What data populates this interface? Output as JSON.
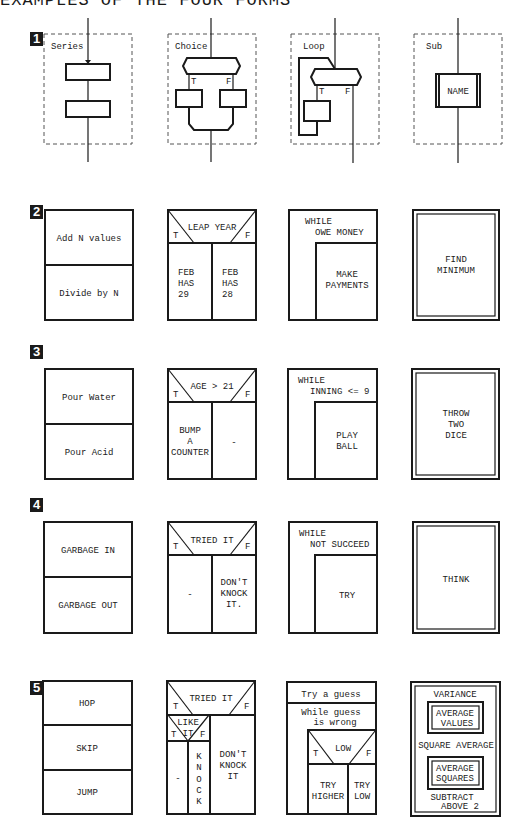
{
  "title": "EXAMPLES OF THE FOUR FORMS",
  "rows": [
    {
      "badge": "1",
      "series_label": "Series",
      "choice_label": "Choice",
      "loop_label": "Loop",
      "sub_label": "Sub",
      "choice_t": "T",
      "choice_f": "F",
      "loop_t": "T",
      "loop_f": "F",
      "sub_name": "NAME"
    },
    {
      "badge": "2",
      "sequence": [
        "Add N values",
        "Divide by N"
      ],
      "if_condition": "LEAP YEAR",
      "if_t": "T",
      "if_f": "F",
      "if_true_lines": [
        "FEB",
        "HAS",
        "29"
      ],
      "if_false_lines": [
        "FEB",
        "HAS",
        "28"
      ],
      "while_lines": [
        "WHILE",
        "OWE MONEY"
      ],
      "while_body_lines": [
        "MAKE",
        "PAYMENTS"
      ],
      "sub_lines": [
        "FIND",
        "MINIMUM"
      ]
    },
    {
      "badge": "3",
      "sequence": [
        "Pour Water",
        "Pour Acid"
      ],
      "if_condition": "AGE > 21",
      "if_t": "T",
      "if_f": "F",
      "if_true_lines": [
        "BUMP",
        "A",
        "COUNTER"
      ],
      "if_false_lines": [
        "-"
      ],
      "while_lines": [
        "WHILE",
        "INNING <= 9"
      ],
      "while_body_lines": [
        "PLAY",
        "BALL"
      ],
      "sub_lines": [
        "THROW",
        "TWO",
        "DICE"
      ]
    },
    {
      "badge": "4",
      "sequence": [
        "GARBAGE IN",
        "GARBAGE OUT"
      ],
      "if_condition": "TRIED IT",
      "if_t": "T",
      "if_f": "F",
      "if_true_lines": [
        "-"
      ],
      "if_false_lines": [
        "DON'T",
        "KNOCK",
        "IT."
      ],
      "while_lines": [
        "WHILE",
        "NOT SUCCEED"
      ],
      "while_body_lines": [
        "TRY"
      ],
      "sub_lines": [
        "THINK"
      ]
    },
    {
      "badge": "5",
      "sequence": [
        "HOP",
        "SKIP",
        "JUMP"
      ],
      "if_condition": "TRIED IT",
      "if_t": "T",
      "if_f": "F",
      "inner_condition_lines": [
        "LIKE",
        "IT"
      ],
      "inner_t": "T",
      "inner_f": "F",
      "inner_true": "-",
      "inner_false_letters": [
        "K",
        "N",
        "O",
        "C",
        "K"
      ],
      "if_false_lines": [
        "DON'T",
        "KNOCK",
        "IT"
      ],
      "top_stmt": "Try a guess",
      "while_lines": [
        "While guess",
        "is wrong"
      ],
      "nested_condition": "LOW",
      "nested_t": "T",
      "nested_f": "F",
      "nested_true_lines": [
        "TRY",
        "HIGHER"
      ],
      "nested_false_lines": [
        "TRY",
        "LOW"
      ],
      "sub_title": "VARIANCE",
      "sub_call1_lines": [
        "AVERAGE",
        "VALUES"
      ],
      "sub_middle": "SQUARE AVERAGE",
      "sub_call2_lines": [
        "AVERAGE",
        "SQUARES"
      ],
      "sub_bottom_lines": [
        "SUBTRACT",
        "ABOVE 2"
      ]
    }
  ]
}
